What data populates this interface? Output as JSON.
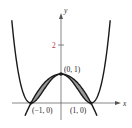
{
  "figure": {
    "axes": {
      "x_label": "x",
      "y_label": "y",
      "y_tick_label": "2"
    },
    "points": [
      {
        "label": "(0, 1)",
        "x": 0,
        "y": 1
      },
      {
        "label": "(−1, 0)",
        "x": -1,
        "y": 0
      },
      {
        "label": "(1, 0)",
        "x": 1,
        "y": 0
      }
    ],
    "curves": [
      {
        "name": "quartic",
        "expr": "y = (x^2 - 1)^2",
        "color": "#1a1a1a"
      },
      {
        "name": "parabola",
        "expr": "y = 1 - x^2",
        "color": "#1a1a1a"
      }
    ],
    "shaded_region": {
      "between": [
        "parabola",
        "quartic"
      ],
      "x_range": [
        -1,
        1
      ],
      "color": "#9a9a9a"
    },
    "colors": {
      "axis": "#555555",
      "tick_label": "#c0304a",
      "curve": "#1a1a1a",
      "shade": "#9a9a9a"
    }
  }
}
